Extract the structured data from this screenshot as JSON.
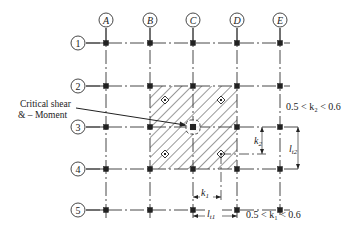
{
  "diagram": {
    "columns": [
      {
        "id": "A",
        "x": 106
      },
      {
        "id": "B",
        "x": 150
      },
      {
        "id": "C",
        "x": 193
      },
      {
        "id": "D",
        "x": 237
      },
      {
        "id": "E",
        "x": 280
      }
    ],
    "rows": [
      {
        "id": "1",
        "y": 43
      },
      {
        "id": "2",
        "y": 86
      },
      {
        "id": "3",
        "y": 127
      },
      {
        "id": "4",
        "y": 169
      },
      {
        "id": "5",
        "y": 210
      }
    ],
    "annotation": {
      "line1": "Critical shear",
      "line2": "& – Moment"
    },
    "dimensions": {
      "k2_label": "k",
      "k2_sub": "2",
      "lt2_label": "l",
      "lt2_sub": "t2",
      "k1_label": "k",
      "k1_sub": "1",
      "lt1_label": "l",
      "lt1_sub": "t1",
      "range_k2": "0.5 < k₂ < 0.6",
      "range_k1": "0.5 < k₁ < 0.6"
    },
    "colors": {
      "line": "#333333",
      "node": "#222222",
      "hatch": "#444444"
    }
  }
}
